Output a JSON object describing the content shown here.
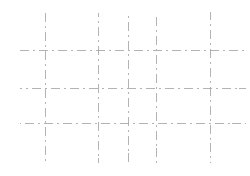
{
  "canvas": {
    "width": 250,
    "height": 176,
    "background": "#ffffff"
  },
  "grid": {
    "description": "empty dashed grid, scanned appearance, no text",
    "line_color": "#a2a7a7",
    "line_thickness": 1,
    "line_style": "dash-dot",
    "dash_pattern": [
      9,
      4,
      2,
      4
    ],
    "vertical_lines": [
      {
        "x": 45,
        "y1": 13,
        "y2": 163
      },
      {
        "x": 98,
        "y1": 13,
        "y2": 163
      },
      {
        "x": 128,
        "y1": 13,
        "y2": 163
      },
      {
        "x": 156,
        "y1": 13,
        "y2": 163
      },
      {
        "x": 210,
        "y1": 12,
        "y2": 163
      }
    ],
    "horizontal_lines": [
      {
        "y": 50,
        "x1": 20,
        "x2": 245
      },
      {
        "y": 88,
        "x1": 20,
        "x2": 246
      },
      {
        "y": 123,
        "x1": 20,
        "x2": 246
      }
    ]
  }
}
